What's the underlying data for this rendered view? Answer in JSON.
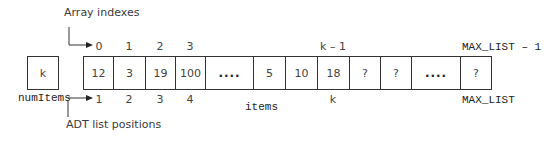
{
  "labels": {
    "array_indexes": "Array indexes",
    "adt_positions": "ADT list positions",
    "num_items": "numItems",
    "items": "items"
  },
  "num_items_box": {
    "value": "k"
  },
  "cells": [
    {
      "value": "12"
    },
    {
      "value": "3"
    },
    {
      "value": "19"
    },
    {
      "value": "100"
    },
    {
      "value": "...."
    },
    {
      "value": "5"
    },
    {
      "value": "10"
    },
    {
      "value": "18"
    },
    {
      "value": "?"
    },
    {
      "value": "?"
    },
    {
      "value": "...."
    },
    {
      "value": "?"
    }
  ],
  "indexes": {
    "i0": "0",
    "i1": "1",
    "i2": "2",
    "i3": "3",
    "k_minus_1": "k – 1",
    "max_list_minus_1": "MAX_LIST – 1"
  },
  "positions": {
    "p1": "1",
    "p2": "2",
    "p3": "3",
    "p4": "4",
    "k": "k",
    "max_list": "MAX_LIST"
  },
  "colors": {
    "line": "#333333",
    "text": "#444444"
  }
}
